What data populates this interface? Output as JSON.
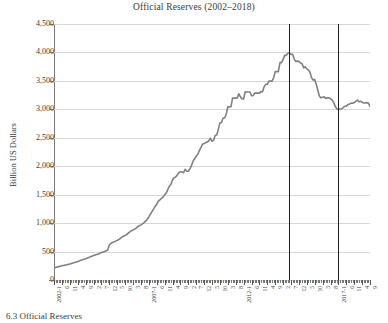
{
  "figure": {
    "title": "Official Reserves (2002–2018)",
    "caption": "6.3 Official Reserves",
    "line_color": "#808080",
    "gridline_color": "#d8d8d8",
    "axis_color": "#6f6f6f",
    "vline_color": "#1d1d1d"
  },
  "axes": {
    "ylabel": "Billion US Dollars",
    "ytick_labels": [
      "4,500",
      "4,000",
      "3,500",
      "3,000",
      "2,500",
      "2,000",
      "1,500",
      "1,000",
      "500",
      "0"
    ],
    "ylim": [
      0,
      4500
    ],
    "xlabel": "",
    "x_start": "2002-1",
    "x_end": "2018-9"
  },
  "reference_lines": [
    {
      "name": "peak-line",
      "x_label": "2014-6",
      "index": 149
    },
    {
      "name": "trough-line",
      "x_label": "2017-1",
      "index": 180
    }
  ],
  "chart_data": {
    "type": "line",
    "title": "Official Reserves (2002–2018)",
    "xlabel": "",
    "ylabel": "Billion US Dollars",
    "ylim": [
      0,
      4500
    ],
    "ytick_values": [
      0,
      500,
      1000,
      1500,
      2000,
      2500,
      3000,
      3500,
      4000,
      4500
    ],
    "grid": true,
    "legend": "none",
    "x_tick_labels": [
      "2002-1",
      "6",
      "11",
      "4",
      "9",
      "2",
      "7",
      "12",
      "5",
      "10",
      "3",
      "8",
      "2007-1",
      "6",
      "11",
      "4",
      "9",
      "2",
      "7",
      "12",
      "5",
      "10",
      "3",
      "8",
      "2012-1",
      "6",
      "11",
      "4",
      "9",
      "2",
      "7",
      "12",
      "5",
      "10",
      "3",
      "8",
      "2017-1",
      "6",
      "11",
      "4",
      "9"
    ],
    "x_tick_step_months": 5,
    "x": [
      "2002-1",
      "2002-2",
      "2002-3",
      "2002-4",
      "2002-5",
      "2002-6",
      "2002-7",
      "2002-8",
      "2002-9",
      "2002-10",
      "2002-11",
      "2002-12",
      "2003-1",
      "2003-2",
      "2003-3",
      "2003-4",
      "2003-5",
      "2003-6",
      "2003-7",
      "2003-8",
      "2003-9",
      "2003-10",
      "2003-11",
      "2003-12",
      "2004-1",
      "2004-2",
      "2004-3",
      "2004-4",
      "2004-5",
      "2004-6",
      "2004-7",
      "2004-8",
      "2004-9",
      "2004-10",
      "2004-11",
      "2004-12",
      "2005-1",
      "2005-2",
      "2005-3",
      "2005-4",
      "2005-5",
      "2005-6",
      "2005-7",
      "2005-8",
      "2005-9",
      "2005-10",
      "2005-11",
      "2005-12",
      "2006-1",
      "2006-2",
      "2006-3",
      "2006-4",
      "2006-5",
      "2006-6",
      "2006-7",
      "2006-8",
      "2006-9",
      "2006-10",
      "2006-11",
      "2006-12",
      "2007-1",
      "2007-2",
      "2007-3",
      "2007-4",
      "2007-5",
      "2007-6",
      "2007-7",
      "2007-8",
      "2007-9",
      "2007-10",
      "2007-11",
      "2007-12",
      "2008-1",
      "2008-2",
      "2008-3",
      "2008-4",
      "2008-5",
      "2008-6",
      "2008-7",
      "2008-8",
      "2008-9",
      "2008-10",
      "2008-11",
      "2008-12",
      "2009-1",
      "2009-2",
      "2009-3",
      "2009-4",
      "2009-5",
      "2009-6",
      "2009-7",
      "2009-8",
      "2009-9",
      "2009-10",
      "2009-11",
      "2009-12",
      "2010-1",
      "2010-2",
      "2010-3",
      "2010-4",
      "2010-5",
      "2010-6",
      "2010-7",
      "2010-8",
      "2010-9",
      "2010-10",
      "2010-11",
      "2010-12",
      "2011-1",
      "2011-2",
      "2011-3",
      "2011-4",
      "2011-5",
      "2011-6",
      "2011-7",
      "2011-8",
      "2011-9",
      "2011-10",
      "2011-11",
      "2011-12",
      "2012-1",
      "2012-2",
      "2012-3",
      "2012-4",
      "2012-5",
      "2012-6",
      "2012-7",
      "2012-8",
      "2012-9",
      "2012-10",
      "2012-11",
      "2012-12",
      "2013-1",
      "2013-2",
      "2013-3",
      "2013-4",
      "2013-5",
      "2013-6",
      "2013-7",
      "2013-8",
      "2013-9",
      "2013-10",
      "2013-11",
      "2013-12",
      "2014-1",
      "2014-2",
      "2014-3",
      "2014-4",
      "2014-5",
      "2014-6",
      "2014-7",
      "2014-8",
      "2014-9",
      "2014-10",
      "2014-11",
      "2014-12",
      "2015-1",
      "2015-2",
      "2015-3",
      "2015-4",
      "2015-5",
      "2015-6",
      "2015-7",
      "2015-8",
      "2015-9",
      "2015-10",
      "2015-11",
      "2015-12",
      "2016-1",
      "2016-2",
      "2016-3",
      "2016-4",
      "2016-5",
      "2016-6",
      "2016-7",
      "2016-8",
      "2016-9",
      "2016-10",
      "2016-11",
      "2016-12",
      "2017-1",
      "2017-2",
      "2017-3",
      "2017-4",
      "2017-5",
      "2017-6",
      "2017-7",
      "2017-8",
      "2017-9",
      "2017-10",
      "2017-11",
      "2017-12",
      "2018-1",
      "2018-2",
      "2018-3",
      "2018-4",
      "2018-5",
      "2018-6",
      "2018-7",
      "2018-8",
      "2018-9"
    ],
    "values": [
      212,
      220,
      228,
      235,
      243,
      250,
      256,
      262,
      268,
      275,
      282,
      291,
      299,
      308,
      316,
      325,
      334,
      346,
      357,
      366,
      375,
      385,
      395,
      408,
      419,
      430,
      440,
      449,
      458,
      471,
      483,
      492,
      500,
      514,
      527,
      615,
      642,
      659,
      671,
      683,
      696,
      711,
      733,
      753,
      769,
      784,
      799,
      825,
      845,
      866,
      879,
      895,
      910,
      941,
      954,
      969,
      988,
      1010,
      1035,
      1068,
      1110,
      1157,
      1202,
      1247,
      1293,
      1333,
      1386,
      1409,
      1434,
      1455,
      1497,
      1528,
      1589,
      1647,
      1682,
      1757,
      1797,
      1809,
      1845,
      1884,
      1906,
      1900,
      1885,
      1946,
      1913,
      1912,
      1954,
      2009,
      2089,
      2132,
      2175,
      2211,
      2273,
      2328,
      2388,
      2399,
      2415,
      2425,
      2447,
      2491,
      2440,
      2454,
      2539,
      2548,
      2648,
      2761,
      2768,
      2847,
      2847,
      2914,
      3044,
      3044,
      3045,
      3197,
      3197,
      3197,
      3201,
      3273,
      3220,
      3181,
      3181,
      3309,
      3304,
      3304,
      3304,
      3240,
      3240,
      3285,
      3285,
      3285,
      3285,
      3312,
      3312,
      3395,
      3440,
      3440,
      3496,
      3496,
      3496,
      3553,
      3662,
      3662,
      3662,
      3821,
      3821,
      3878,
      3948,
      3948,
      3986,
      3993,
      3965,
      3968,
      3888,
      3843,
      3847,
      3843,
      3813,
      3802,
      3730,
      3748,
      3711,
      3694,
      3651,
      3557,
      3514,
      3526,
      3438,
      3330,
      3231,
      3202,
      3213,
      3220,
      3192,
      3205,
      3201,
      3185,
      3166,
      3121,
      3052,
      3011,
      2998,
      3005,
      3009,
      3030,
      3054,
      3057,
      3081,
      3092,
      3109,
      3109,
      3119,
      3140,
      3161,
      3134,
      3143,
      3125,
      3111,
      3112,
      3118,
      3110,
      3050
    ],
    "annotations": [
      {
        "type": "vline",
        "x": "2014-6",
        "label": "peak"
      },
      {
        "type": "vline",
        "x": "2017-1",
        "label": "trough"
      }
    ]
  }
}
